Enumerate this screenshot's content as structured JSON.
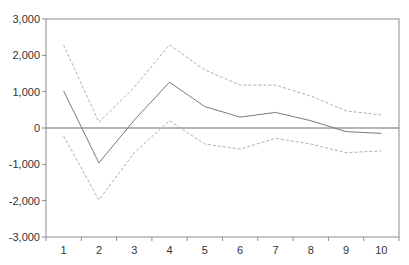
{
  "chart_data": {
    "type": "line",
    "title": "",
    "xlabel": "",
    "ylabel": "",
    "categories": [
      "1",
      "2",
      "3",
      "4",
      "5",
      "6",
      "7",
      "8",
      "9",
      "10"
    ],
    "ylim": [
      -3000,
      3000
    ],
    "yticks": [
      3000,
      2000,
      1000,
      0,
      -1000,
      -2000,
      -3000
    ],
    "ytick_labels": [
      "3,000",
      "2,000",
      "1,000",
      "0",
      "-1,000",
      "-2,000",
      "-3,000"
    ],
    "grid": false,
    "legend": null,
    "zero_line": true,
    "series": [
      {
        "name": "upper",
        "style": "dashed",
        "color": "#b0b0b0",
        "values": [
          2290,
          160,
          1120,
          2290,
          1600,
          1180,
          1180,
          880,
          470,
          360
        ]
      },
      {
        "name": "response",
        "style": "solid",
        "color": "#7a7a7a",
        "values": [
          1020,
          -960,
          220,
          1260,
          590,
          300,
          430,
          200,
          -100,
          -150
        ]
      },
      {
        "name": "lower",
        "style": "dashed",
        "color": "#b0b0b0",
        "values": [
          -220,
          -1980,
          -680,
          200,
          -440,
          -580,
          -285,
          -440,
          -680,
          -630
        ]
      }
    ]
  }
}
